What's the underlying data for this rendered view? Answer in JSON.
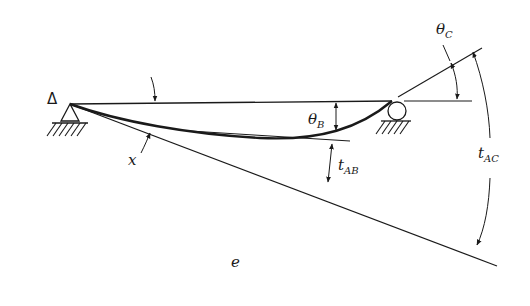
{
  "diagram": {
    "caption": "e",
    "colors": {
      "ink": "#1a1a1a",
      "background": "#ffffff"
    },
    "labels": {
      "delta": "Δ",
      "x": "x",
      "theta_b": {
        "main": "θ",
        "sub": "B"
      },
      "theta_c": {
        "main": "θ",
        "sub": "C"
      },
      "t_ab": {
        "main": "t",
        "sub": "AB"
      },
      "t_ac": {
        "main": "t",
        "sub": "AC"
      }
    },
    "elements": [
      "pin-support-A",
      "roller-support-C",
      "chord-AC",
      "elastic-curve",
      "tangent-at-A",
      "tangent-at-B",
      "tangent-at-C",
      "dimension-theta-B",
      "dimension-t-AB",
      "dimension-theta-C",
      "dimension-t-AC"
    ]
  }
}
